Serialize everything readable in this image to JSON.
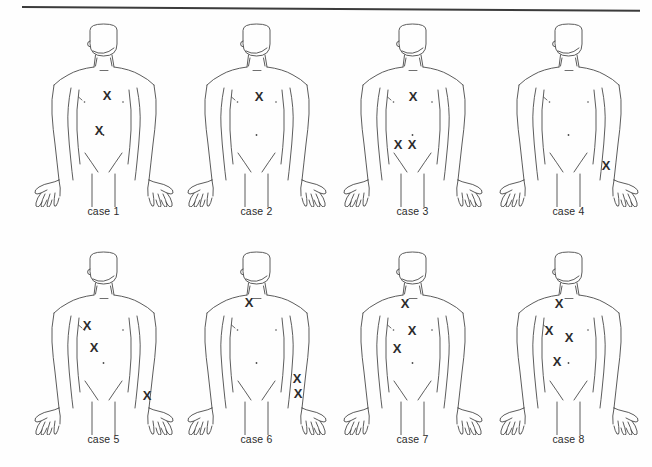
{
  "page": {
    "rule_present": true,
    "grid": {
      "columns": 4,
      "rows": 2
    }
  },
  "figure": {
    "view": "anterior",
    "landmarks": [
      "head",
      "neck",
      "suprasternal-notch",
      "nipples",
      "umbilicus",
      "inguinal-creases",
      "arms",
      "hands"
    ]
  },
  "cases": [
    {
      "id": "case-1",
      "label": "case 1",
      "cell": {
        "x": 22,
        "y": 22
      },
      "marks": [
        {
          "name": "x-mark-chest-center",
          "region": "central chest",
          "x": 85,
          "y": 73
        },
        {
          "name": "x-mark-epigastrium",
          "region": "left upper abdomen",
          "x": 77,
          "y": 108
        }
      ]
    },
    {
      "id": "case-2",
      "label": "case 2",
      "cell": {
        "x": 175,
        "y": 22
      },
      "marks": [
        {
          "name": "x-mark-chest-center",
          "region": "central chest",
          "x": 84,
          "y": 74
        }
      ]
    },
    {
      "id": "case-3",
      "label": "case 3",
      "cell": {
        "x": 331,
        "y": 22
      },
      "marks": [
        {
          "name": "x-mark-chest-center",
          "region": "central chest",
          "x": 82,
          "y": 74
        },
        {
          "name": "x-mark-abdomen-left",
          "region": "mid abdomen left",
          "x": 67,
          "y": 122
        },
        {
          "name": "x-mark-abdomen-right",
          "region": "mid abdomen right",
          "x": 81,
          "y": 122
        }
      ]
    },
    {
      "id": "case-4",
      "label": "case 4",
      "cell": {
        "x": 487,
        "y": 22
      },
      "marks": [
        {
          "name": "x-mark-wrist-right",
          "region": "right wrist",
          "x": 119,
          "y": 143
        }
      ]
    },
    {
      "id": "case-5",
      "label": "case 5",
      "cell": {
        "x": 22,
        "y": 250
      },
      "marks": [
        {
          "name": "x-mark-chest-left",
          "region": "left chest",
          "x": 65,
          "y": 75
        },
        {
          "name": "x-mark-abdomen-left",
          "region": "left upper abdomen",
          "x": 72,
          "y": 97
        },
        {
          "name": "x-mark-wrist-right",
          "region": "right wrist",
          "x": 125,
          "y": 145
        }
      ]
    },
    {
      "id": "case-6",
      "label": "case 6",
      "cell": {
        "x": 175,
        "y": 250
      },
      "marks": [
        {
          "name": "x-mark-neck-left",
          "region": "left neck base",
          "x": 74,
          "y": 52
        },
        {
          "name": "x-mark-forearm-right-upper",
          "region": "right forearm",
          "x": 122,
          "y": 128
        },
        {
          "name": "x-mark-forearm-right-lower",
          "region": "right forearm distal",
          "x": 123,
          "y": 143
        }
      ]
    },
    {
      "id": "case-7",
      "label": "case 7",
      "cell": {
        "x": 331,
        "y": 250
      },
      "marks": [
        {
          "name": "x-mark-suprasternal-notch",
          "region": "suprasternal notch",
          "x": 74,
          "y": 53
        },
        {
          "name": "x-mark-chest-center",
          "region": "central chest",
          "x": 81,
          "y": 80
        },
        {
          "name": "x-mark-chest-left",
          "region": "left mid chest",
          "x": 66,
          "y": 98
        }
      ]
    },
    {
      "id": "case-8",
      "label": "case 8",
      "cell": {
        "x": 487,
        "y": 250
      },
      "marks": [
        {
          "name": "x-mark-suprasternal-notch",
          "region": "suprasternal notch",
          "x": 72,
          "y": 53
        },
        {
          "name": "x-mark-chest-left",
          "region": "left chest",
          "x": 62,
          "y": 80
        },
        {
          "name": "x-mark-chest-center",
          "region": "central chest",
          "x": 82,
          "y": 87
        },
        {
          "name": "x-mark-abdomen-center",
          "region": "mid abdomen",
          "x": 70,
          "y": 111
        }
      ]
    }
  ],
  "glyphs": {
    "mark": "X"
  },
  "colors": {
    "ink": "#2c2c2c",
    "outline": "#4a4a4a",
    "rule": "#3b3b3b",
    "paper": "#fefefe"
  }
}
